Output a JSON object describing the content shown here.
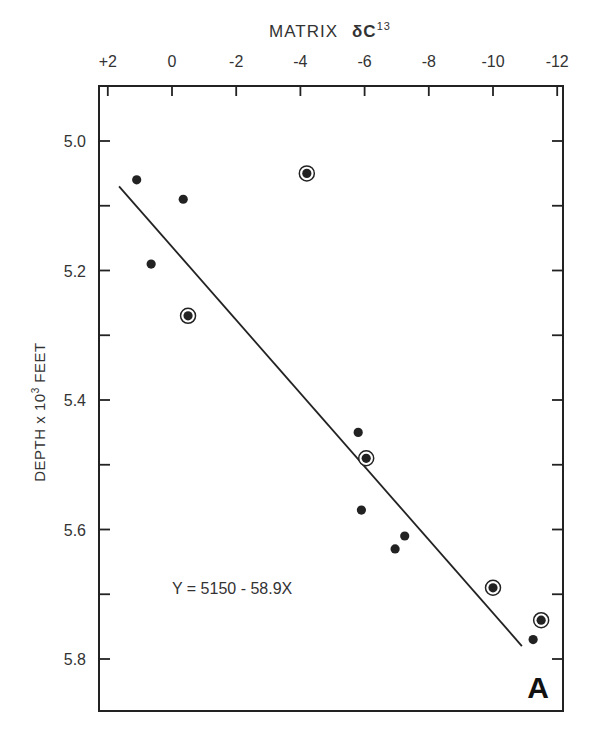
{
  "chart_data": {
    "type": "scatter",
    "panel_label": "A",
    "title": "",
    "xlabel": "MATRIX δC¹³",
    "xlabel_main": "MATRIX",
    "xlabel_symbol": "δC",
    "xlabel_sup": "13",
    "ylabel": "DEPTH x 10³ FEET",
    "ylabel_main": "DEPTH x 10",
    "ylabel_sup": "3",
    "ylabel_tail": " FEET",
    "x_axis_position": "top",
    "x_reversed": true,
    "y_reversed": true,
    "xlim": [
      2,
      -12
    ],
    "ylim": [
      4.9,
      5.88
    ],
    "x_ticks": [
      "+2",
      "0",
      "-2",
      "-4",
      "-6",
      "-8",
      "-10",
      "-12"
    ],
    "x_tick_values": [
      2,
      0,
      -2,
      -4,
      -6,
      -8,
      -10,
      -12
    ],
    "y_ticks": [
      "5.0",
      "5.2",
      "5.4",
      "5.6",
      "5.8"
    ],
    "y_tick_values": [
      5.0,
      5.2,
      5.4,
      5.6,
      5.8
    ],
    "y_minor_ticks": [
      5.0,
      5.1,
      5.2,
      5.3,
      5.4,
      5.5,
      5.6,
      5.7,
      5.8
    ],
    "grid": false,
    "annotation": "Y = 5150 - 58.9X",
    "series": [
      {
        "name": "samples",
        "marker": "filled-dot",
        "points": [
          {
            "x": 1.1,
            "y": 5.06
          },
          {
            "x": -0.35,
            "y": 5.09
          },
          {
            "x": 0.65,
            "y": 5.19
          },
          {
            "x": -5.8,
            "y": 5.45
          },
          {
            "x": -5.9,
            "y": 5.57
          },
          {
            "x": -7.25,
            "y": 5.61
          },
          {
            "x": -6.95,
            "y": 5.63
          },
          {
            "x": -11.25,
            "y": 5.77
          }
        ]
      },
      {
        "name": "circled samples",
        "marker": "circled-dot",
        "points": [
          {
            "x": -4.2,
            "y": 5.05
          },
          {
            "x": -0.5,
            "y": 5.27
          },
          {
            "x": -6.05,
            "y": 5.49
          },
          {
            "x": -10.0,
            "y": 5.69
          },
          {
            "x": -11.5,
            "y": 5.74
          }
        ]
      }
    ],
    "regression_line": {
      "equation": "Y = 5150 - 58.9X",
      "x_start": 1.65,
      "y_start": 5.07,
      "x_end": -10.9,
      "y_end": 5.78
    }
  },
  "colors": {
    "ink": "#222222",
    "background": "#ffffff"
  }
}
